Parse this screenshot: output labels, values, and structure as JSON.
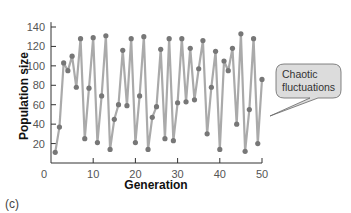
{
  "panel_label": "(c)",
  "callout": {
    "line1": "Chaotic",
    "line2": "fluctuations"
  },
  "colors": {
    "line": "#aaaaaa",
    "marker": "#777777",
    "axis": "#333333",
    "callout_fill": "#dcdcdc",
    "callout_stroke": "#666666"
  },
  "chart_data": {
    "type": "line",
    "title": "",
    "xlabel": "Generation",
    "ylabel": "Population size",
    "xlim": [
      0,
      50
    ],
    "ylim": [
      0,
      145
    ],
    "xticks": [
      0,
      10,
      20,
      30,
      40,
      50
    ],
    "yticks": [
      20,
      40,
      60,
      80,
      100,
      120,
      140
    ],
    "grid": false,
    "legend": null,
    "annotations": [
      {
        "text": "Chaotic fluctuations",
        "type": "callout"
      }
    ],
    "series": [
      {
        "name": "Population size",
        "x": [
          1,
          2,
          3,
          4,
          5,
          6,
          7,
          8,
          9,
          10,
          11,
          12,
          13,
          14,
          15,
          16,
          17,
          18,
          19,
          20,
          21,
          22,
          23,
          24,
          25,
          26,
          27,
          28,
          29,
          30,
          31,
          32,
          33,
          34,
          35,
          36,
          37,
          38,
          39,
          40,
          41,
          42,
          43,
          44,
          45,
          46,
          47,
          48,
          49,
          50
        ],
        "values": [
          11,
          37,
          103,
          95,
          110,
          78,
          128,
          25,
          77,
          129,
          21,
          69,
          131,
          14,
          45,
          60,
          116,
          59,
          128,
          21,
          69,
          130,
          14,
          47,
          58,
          117,
          25,
          128,
          23,
          62,
          128,
          63,
          118,
          65,
          97,
          126,
          30,
          78,
          115,
          14,
          105,
          95,
          118,
          40,
          133,
          12,
          55,
          128,
          20,
          86
        ]
      }
    ]
  }
}
